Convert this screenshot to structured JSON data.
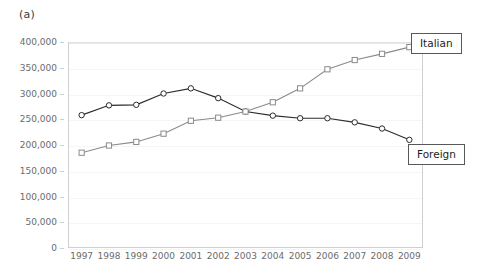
{
  "figure": {
    "panel_letter": "(a)"
  },
  "chart_data": {
    "type": "line",
    "title": "",
    "subtitle": "",
    "xlabel": "",
    "ylabel": "",
    "categories": [
      "1997",
      "1998",
      "1999",
      "2000",
      "2001",
      "2002",
      "2003",
      "2004",
      "2005",
      "2006",
      "2007",
      "2008",
      "2009"
    ],
    "x": [
      1997,
      1998,
      1999,
      2000,
      2001,
      2002,
      2003,
      2004,
      2005,
      2006,
      2007,
      2008,
      2009
    ],
    "ylim": [
      0,
      400000
    ],
    "yticks": [
      0,
      50000,
      100000,
      150000,
      200000,
      250000,
      300000,
      350000,
      400000
    ],
    "ytick_labels": [
      "0",
      "50,000",
      "100,000",
      "150,000",
      "200,000",
      "250,000",
      "300,000",
      "350,000",
      "400,000"
    ],
    "grid": true,
    "grid_axis": "y",
    "legend": "inline-callouts",
    "series": [
      {
        "name": "Foreign",
        "marker": "circle",
        "color": "#2b2b2b",
        "values": [
          258000,
          277000,
          278000,
          300000,
          310000,
          291000,
          265000,
          257000,
          252000,
          252000,
          244000,
          232000,
          210000
        ]
      },
      {
        "name": "Italian",
        "marker": "square",
        "color": "#8a8a8a",
        "values": [
          185000,
          199000,
          206000,
          222000,
          247000,
          253000,
          265000,
          283000,
          310000,
          347000,
          365000,
          377000,
          390000
        ]
      }
    ],
    "annotations": [
      {
        "label": "Italian",
        "series": "Italian",
        "anchor_year": 2009
      },
      {
        "label": "Foreign",
        "series": "Foreign",
        "anchor_year": 2009
      }
    ]
  },
  "colors": {
    "foreign_line": "#2b2b2b",
    "italian_line": "#8a8a8a",
    "gridline": "#f7f4f5",
    "axis": "#cfcfcf",
    "tick_text": "#6b6b6b",
    "callout_border": "#585858",
    "background": "#ffffff"
  }
}
